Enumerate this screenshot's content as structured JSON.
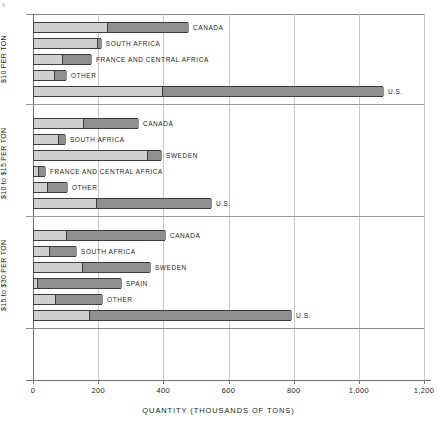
{
  "corner_mark": "Ⅱ",
  "chart_data": {
    "type": "bar",
    "orientation": "horizontal",
    "stacked": true,
    "title": "",
    "xlabel": "QUANTITY (THOUSANDS OF TONS)",
    "ylabel": "",
    "xlim": [
      0,
      1200
    ],
    "xticks": [
      0,
      200,
      400,
      600,
      800,
      1000,
      1200
    ],
    "xticklabels": [
      "0",
      "200",
      "400",
      "600",
      "800",
      "1,000",
      "1,200"
    ],
    "grid": true,
    "legend": "none",
    "colors": {
      "segment_light": "#cfcfcf",
      "segment_dark": "#8f8f8f",
      "outline": "#3d3d3d",
      "gridline": "#c9c9c9",
      "axis": "#6f6f6f",
      "text": "#231f20"
    },
    "panels": [
      {
        "group_label": "$10 PER TON",
        "bars": [
          {
            "label": "CANADA",
            "light": 224,
            "dark": 252,
            "total": 476
          },
          {
            "label": "SOUTH AFRICA",
            "light": 193,
            "dark": 15,
            "total": 208
          },
          {
            "label": "FRANCE AND CENTRAL AFRICA",
            "light": 86,
            "dark": 92,
            "total": 178
          },
          {
            "label": "OTHER",
            "light": 61,
            "dark": 40,
            "total": 101
          },
          {
            "label": "U.S.",
            "light": 393,
            "dark": 681,
            "total": 1074
          }
        ]
      },
      {
        "group_label": "$10 to $15 PER TON",
        "bars": [
          {
            "label": "CANADA",
            "light": 150,
            "dark": 172,
            "total": 322
          },
          {
            "label": "SOUTH AFRICA",
            "light": 74,
            "dark": 24,
            "total": 98
          },
          {
            "label": "SWEDEN",
            "light": 347,
            "dark": 46,
            "total": 393
          },
          {
            "label": "FRANCE AND CENTRAL AFRICA",
            "light": 12,
            "dark": 25,
            "total": 37
          },
          {
            "label": "OTHER",
            "light": 40,
            "dark": 64,
            "total": 104
          },
          {
            "label": "U.S.",
            "light": 190,
            "dark": 356,
            "total": 546
          }
        ]
      },
      {
        "group_label": "$15 to $30 PER TON",
        "bars": [
          {
            "label": "CANADA",
            "light": 98,
            "dark": 307,
            "total": 405
          },
          {
            "label": "SOUTH AFRICA",
            "light": 46,
            "dark": 86,
            "total": 132
          },
          {
            "label": "SWEDEN",
            "light": 147,
            "dark": 212,
            "total": 359
          },
          {
            "label": "SPAIN",
            "light": 9,
            "dark": 261,
            "total": 270
          },
          {
            "label": "OTHER",
            "light": 64,
            "dark": 148,
            "total": 212
          },
          {
            "label": "U.S.",
            "light": 169,
            "dark": 623,
            "total": 792
          }
        ]
      }
    ]
  }
}
